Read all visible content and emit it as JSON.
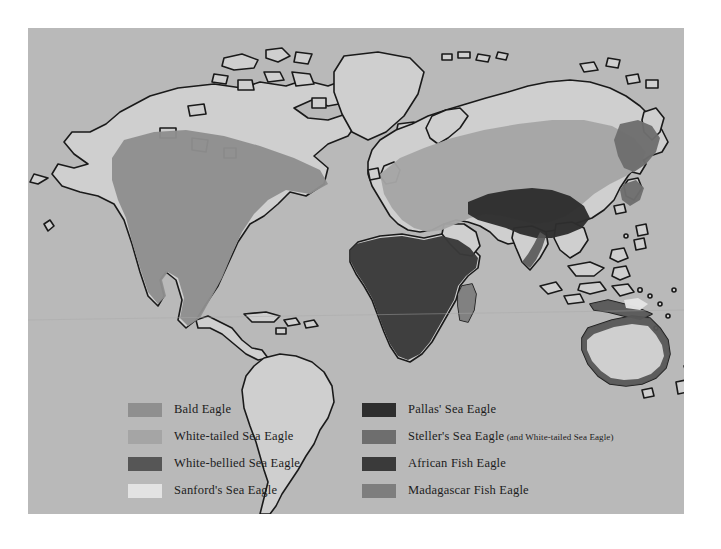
{
  "map": {
    "colors": {
      "ocean": "#b9b9b9",
      "land": "#cfcfcf",
      "coastline": "#1a1a1a",
      "bald_eagle": "#8f8f8f",
      "white_tailed": "#a5a5a5",
      "white_bellied": "#565656",
      "sanfords": "#e3e3e3",
      "pallas": "#2e2e2e",
      "stellers": "#6e6e6e",
      "african": "#3a3a3a",
      "madagascar": "#7e7e7e"
    }
  },
  "legend": {
    "left": [
      {
        "label": "Bald Eagle",
        "color": "#8f8f8f"
      },
      {
        "label": "White-tailed Sea Eagle",
        "color": "#a5a5a5"
      },
      {
        "label": "White-bellied Sea Eagle",
        "color": "#565656"
      },
      {
        "label": "Sanford's Sea Eagle",
        "color": "#e3e3e3"
      }
    ],
    "right": [
      {
        "label": "Pallas' Sea Eagle",
        "color": "#2e2e2e"
      },
      {
        "label": "Steller's Sea Eagle",
        "note": " (and White-tailed Sea Eagle)",
        "color": "#6e6e6e"
      },
      {
        "label": "African Fish Eagle",
        "color": "#3a3a3a"
      },
      {
        "label": "Madagascar Fish Eagle",
        "color": "#7e7e7e"
      }
    ]
  }
}
